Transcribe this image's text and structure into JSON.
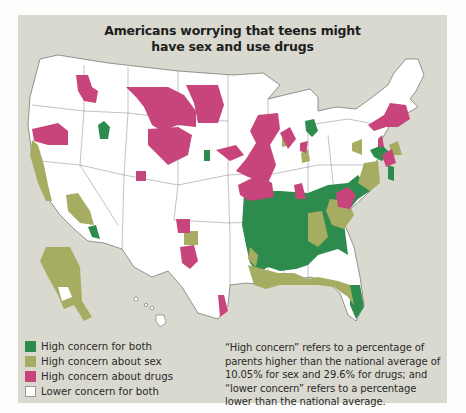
{
  "figure": {
    "title_line1": "Americans worrying that teens might",
    "title_line2": "have sex and use drugs",
    "background_color": "#d9d9cf"
  },
  "legend": {
    "items": [
      {
        "label": "High concern for both",
        "color": "#2e8b4e",
        "key": "both"
      },
      {
        "label": "High concern about sex",
        "color": "#a6ad62",
        "key": "sex"
      },
      {
        "label": "High concern about drugs",
        "color": "#c8457b",
        "key": "drugs"
      },
      {
        "label": "Lower concern for both",
        "color": "#ffffff",
        "key": "lower"
      }
    ]
  },
  "note": {
    "text": "“High concern” refers to a percentage of parents higher than the national average of 10.05% for sex and 29.6% for drugs; and “lower concern” refers to a percentage lower than the national average."
  },
  "map": {
    "region": "United States (incl. Alaska and Hawaii insets)",
    "national_average_sex_pct": 10.05,
    "national_average_drugs_pct": 29.6,
    "regions_summary": [
      {
        "area": "Southeast (TN, MS, AL, GA, SC, NC, AR, LA)",
        "category": "both"
      },
      {
        "area": "Gulf coast / Florida panhandle / Texas east",
        "category": "sex"
      },
      {
        "area": "Northern Plains (MT, ND, WY)",
        "category": "drugs"
      },
      {
        "area": "Upper Midwest (MN, WI, IA, MO)",
        "category": "drugs"
      },
      {
        "area": "New England / New York",
        "category": "drugs"
      },
      {
        "area": "California coast",
        "category": "sex"
      },
      {
        "area": "Alaska",
        "category": "sex"
      },
      {
        "area": "Southern Arizona",
        "category": "both"
      },
      {
        "area": "Oklahoma / Texas panhandle",
        "category": "drugs"
      },
      {
        "area": "Virginia / Pennsylvania",
        "category": "sex"
      }
    ]
  }
}
